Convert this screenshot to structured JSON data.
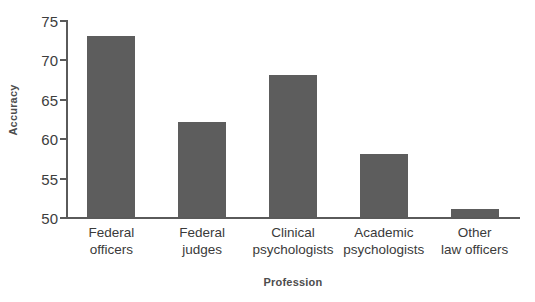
{
  "chart_data": {
    "type": "bar",
    "title": "",
    "xlabel": "Profession",
    "ylabel": "Accuracy",
    "categories": [
      "Federal\nofficers",
      "Federal\njudges",
      "Clinical\npsychologists",
      "Academic\npsychologists",
      "Other\nlaw officers"
    ],
    "values": [
      73,
      62,
      68,
      58,
      51
    ],
    "ylim": [
      50,
      75
    ],
    "yticks": [
      50,
      55,
      60,
      65,
      70,
      75
    ],
    "ytick_labels": [
      "50",
      "55",
      "60",
      "65",
      "70",
      "75"
    ],
    "grid": false,
    "legend": null,
    "bar_color": "#5d5d5d",
    "axis_color": "#5a5a5a",
    "background": "#ffffff"
  }
}
